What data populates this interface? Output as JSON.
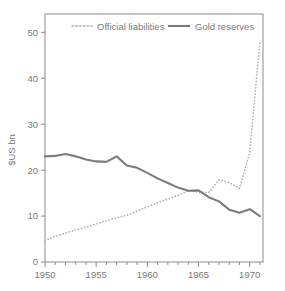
{
  "chart_data": {
    "type": "line",
    "title": "",
    "subtitle": "",
    "xlabel": "",
    "ylabel": "$US bn",
    "xlim": [
      1950,
      1971.3
    ],
    "ylim": [
      0,
      54
    ],
    "grid": false,
    "legend_position": "top-inside",
    "x_ticks_major": [
      "1950",
      "1955",
      "1960",
      "1965",
      "1970"
    ],
    "x_ticks_major_values": [
      1950,
      1955,
      1960,
      1965,
      1970
    ],
    "x_ticks_minor_values": [
      1951,
      1952,
      1953,
      1954,
      1956,
      1957,
      1958,
      1959,
      1961,
      1962,
      1963,
      1964,
      1966,
      1967,
      1968,
      1969,
      1971
    ],
    "y_ticks": [
      "0",
      "10",
      "20",
      "30",
      "40",
      "50"
    ],
    "y_ticks_values": [
      0,
      10,
      20,
      30,
      40,
      50
    ],
    "x": [
      1950,
      1951,
      1952,
      1953,
      1954,
      1955,
      1956,
      1957,
      1958,
      1959,
      1960,
      1961,
      1962,
      1963,
      1964,
      1965,
      1966,
      1967,
      1968,
      1969,
      1970,
      1971
    ],
    "series": [
      {
        "name": "Official liabilities",
        "style": "dotted",
        "color": "#b4b4b4",
        "values": [
          4.7,
          5.6,
          6.3,
          7.0,
          7.6,
          8.3,
          9.0,
          9.6,
          10.2,
          11.1,
          12.0,
          12.9,
          13.7,
          14.5,
          15.5,
          15.2,
          15.1,
          17.9,
          17.3,
          16.0,
          23.8,
          48.0
        ]
      },
      {
        "name": "Gold reserves",
        "style": "solid",
        "color": "#7c7c7c",
        "values": [
          23.0,
          23.1,
          23.5,
          23.0,
          22.3,
          21.9,
          21.8,
          23.0,
          21.0,
          20.5,
          19.4,
          18.2,
          17.2,
          16.2,
          15.5,
          15.6,
          14.1,
          13.2,
          11.4,
          10.7,
          11.5,
          10.0
        ]
      }
    ]
  },
  "legend": {
    "items": [
      {
        "label": "Official liabilities",
        "style": "dotted"
      },
      {
        "label": "Gold reserves",
        "style": "solid"
      }
    ]
  },
  "axes": {
    "y_title": "$US bn"
  },
  "colors": {
    "frame": "#8c8c8c",
    "dotted_series": "#b4b4b4",
    "solid_series": "#7c7c7c",
    "text": "#7a7a7a",
    "background": "#ffffff"
  }
}
